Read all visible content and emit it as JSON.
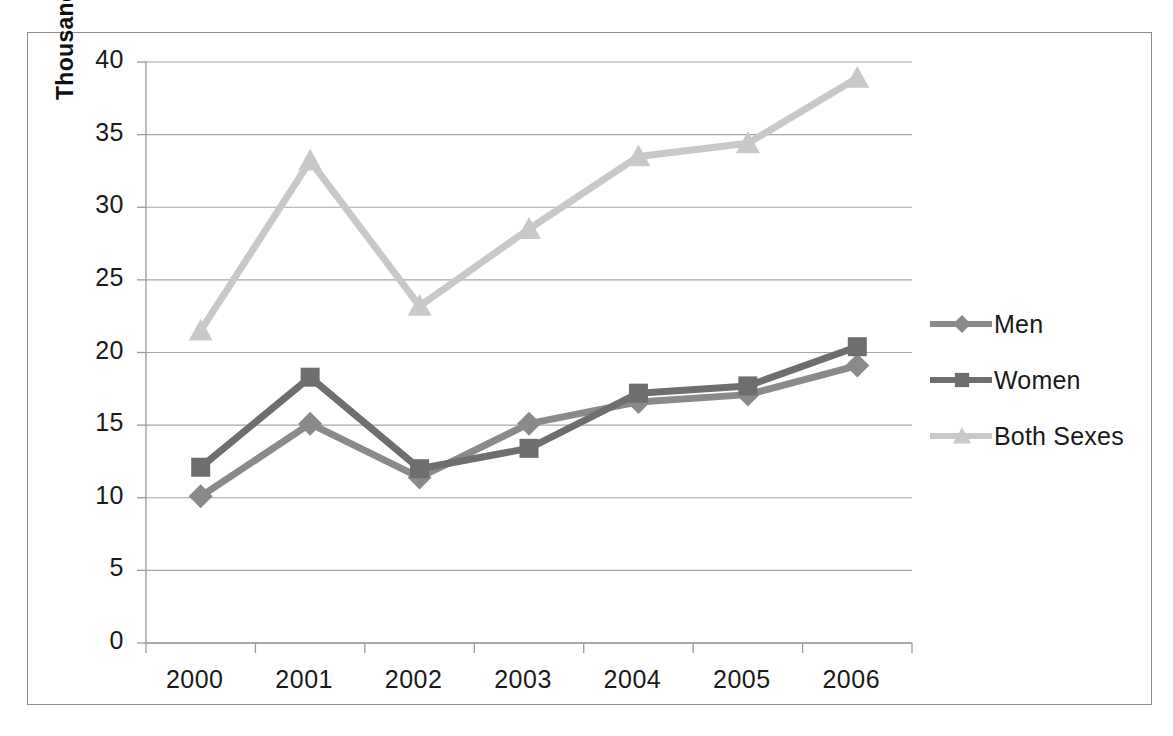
{
  "chart_data": {
    "type": "line",
    "title": "",
    "subtitle": "",
    "xlabel": "",
    "ylabel": "Thousands",
    "categories": [
      "2000",
      "2001",
      "2002",
      "2003",
      "2004",
      "2005",
      "2006"
    ],
    "ylim": [
      0,
      40
    ],
    "ytick_step": 5,
    "yticks": [
      "40",
      "35",
      "30",
      "25",
      "20",
      "15",
      "10",
      "5",
      "0"
    ],
    "grid": "horizontal",
    "legend_position": "right",
    "series": [
      {
        "name": "Men",
        "marker": "diamond",
        "color": "#8a8a8a",
        "values": [
          10.1,
          15.1,
          11.4,
          15.1,
          16.6,
          17.1,
          19.1
        ]
      },
      {
        "name": "Women",
        "marker": "square",
        "color": "#6e6e6e",
        "values": [
          12.1,
          18.3,
          12.0,
          13.4,
          17.2,
          17.7,
          20.4
        ]
      },
      {
        "name": "Both Sexes",
        "marker": "triangle",
        "color": "#c9c9c9",
        "values": [
          21.5,
          33.2,
          23.2,
          28.5,
          33.5,
          34.4,
          38.9
        ]
      }
    ]
  },
  "legend": {
    "items": [
      {
        "label": "Men"
      },
      {
        "label": "Women"
      },
      {
        "label": "Both Sexes"
      }
    ]
  },
  "colors": {
    "men": "#8a8a8a",
    "women": "#6e6e6e",
    "both_sexes": "#c9c9c9",
    "gridline": "#a6a6a6",
    "axis": "#9a9a9a",
    "frame": "#8d8d8d",
    "text": "#1a1a1a"
  }
}
